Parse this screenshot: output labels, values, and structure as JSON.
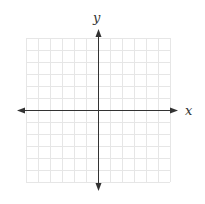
{
  "diagram": {
    "type": "coordinate-plane",
    "x_axis_label": "x",
    "y_axis_label": "y",
    "grid": {
      "columns": 12,
      "rows": 12,
      "left": 26,
      "top": 38,
      "cell": 12,
      "line_color": "#e6e6e6"
    },
    "axes": {
      "origin_x": 98,
      "origin_y": 110,
      "x_start": 17,
      "x_end": 178,
      "y_start": 29,
      "y_end": 191,
      "color": "#333333"
    }
  }
}
